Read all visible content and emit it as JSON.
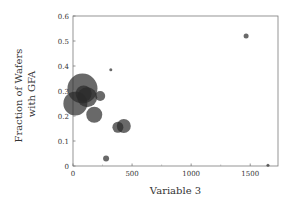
{
  "chart_data": {
    "type": "scatter",
    "subtype": "bubble",
    "title": "",
    "xlabel": "Variable 3",
    "ylabel_lines": [
      "Fraction of Wafers",
      "with GFA"
    ],
    "ylabel": "Fraction of Wafers with GFA",
    "xlim": [
      0,
      1735
    ],
    "ylim": [
      0,
      0.6
    ],
    "xticks": [
      0,
      500,
      1000,
      1500
    ],
    "yticks": [
      0,
      0.1,
      0.2,
      0.3,
      0.4,
      0.5,
      0.6
    ],
    "xtick_labels": [
      "0",
      "500",
      "1000",
      "1500"
    ],
    "ytick_labels": [
      "0",
      "0.1",
      "0.2",
      "0.3",
      "0.4",
      "0.5",
      "0.6"
    ],
    "grid": false,
    "legend": null,
    "marker_color": "#2a2a2a",
    "marker_opacity": 0.7,
    "points": [
      {
        "x": 80,
        "y": 0.31,
        "size": 15
      },
      {
        "x": 20,
        "y": 0.25,
        "size": 12
      },
      {
        "x": 120,
        "y": 0.275,
        "size": 10
      },
      {
        "x": 90,
        "y": 0.29,
        "size": 8
      },
      {
        "x": 230,
        "y": 0.28,
        "size": 5
      },
      {
        "x": 180,
        "y": 0.205,
        "size": 8
      },
      {
        "x": 380,
        "y": 0.155,
        "size": 5.5
      },
      {
        "x": 430,
        "y": 0.16,
        "size": 7
      },
      {
        "x": 280,
        "y": 0.03,
        "size": 3
      },
      {
        "x": 320,
        "y": 0.385,
        "size": 1.5
      },
      {
        "x": 1465,
        "y": 0.52,
        "size": 2.5
      },
      {
        "x": 1650,
        "y": 0.003,
        "size": 1.5
      }
    ]
  },
  "layout": {
    "plot_left": 73,
    "plot_right": 278,
    "plot_top": 16,
    "plot_bottom": 166,
    "x_title_y": 194,
    "y_title_x": 22
  }
}
